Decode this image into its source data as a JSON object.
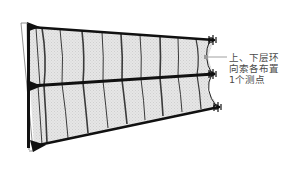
{
  "diagram": {
    "type": "structural-schematic",
    "annotation": {
      "lines": [
        "上、下层环",
        "向索各布置",
        "1个测点"
      ],
      "full_text": "上、下层环向索各布置1个测点",
      "color": "#4a4a4a"
    },
    "colors": {
      "membrane_fill": "#e4e4e4",
      "chord": "#111111",
      "rib": "#3a3a3a",
      "frame": "#777777",
      "leader": "#888888"
    },
    "chords": [
      {
        "name": "upper-ring-cable",
        "x1": 30,
        "y1": 27,
        "x2": 214,
        "y2": 40
      },
      {
        "name": "middle-ring-cable",
        "x1": 30,
        "y1": 86,
        "x2": 214,
        "y2": 74
      },
      {
        "name": "lower-ring-cable",
        "x1": 34,
        "y1": 146,
        "x2": 219,
        "y2": 107
      }
    ],
    "rib_count_per_layer": 10,
    "measuring_points": 2
  }
}
